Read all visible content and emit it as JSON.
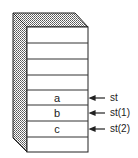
{
  "diagram": {
    "type": "stack",
    "cells": [
      {
        "label": ""
      },
      {
        "label": ""
      },
      {
        "label": ""
      },
      {
        "label": ""
      },
      {
        "label": "a"
      },
      {
        "label": "b"
      },
      {
        "label": "c"
      },
      {
        "label": ""
      }
    ],
    "pointers": [
      {
        "label": "st",
        "cell_index": 4
      },
      {
        "label": "st(1)",
        "cell_index": 5
      },
      {
        "label": "st(2)",
        "cell_index": 6
      }
    ],
    "colors": {
      "stroke": "#222222",
      "shade": "#888888"
    }
  }
}
